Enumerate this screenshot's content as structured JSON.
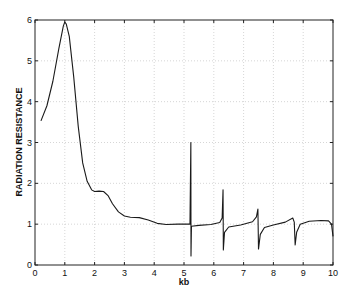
{
  "chart_data": {
    "type": "line",
    "title": "",
    "xlabel": "kb",
    "ylabel": "RADIATION  RESISTANCE",
    "xlim": [
      0,
      10
    ],
    "ylim": [
      0,
      6
    ],
    "grid": true,
    "legend": null,
    "x_ticks": [
      "0",
      "1",
      "2",
      "3",
      "4",
      "5",
      "6",
      "7",
      "8",
      "9",
      "10"
    ],
    "y_ticks": [
      "0",
      "1",
      "2",
      "3",
      "4",
      "5",
      "6"
    ],
    "series": [
      {
        "name": "radiation resistance",
        "color": "#1a1a1a",
        "points": [
          [
            0.2,
            3.53
          ],
          [
            0.4,
            3.9
          ],
          [
            0.6,
            4.5
          ],
          [
            0.8,
            5.3
          ],
          [
            0.95,
            5.85
          ],
          [
            1.0,
            5.95
          ],
          [
            1.05,
            5.9
          ],
          [
            1.15,
            5.6
          ],
          [
            1.3,
            4.6
          ],
          [
            1.45,
            3.4
          ],
          [
            1.6,
            2.5
          ],
          [
            1.75,
            2.05
          ],
          [
            1.9,
            1.84
          ],
          [
            2.0,
            1.8
          ],
          [
            2.15,
            1.81
          ],
          [
            2.3,
            1.8
          ],
          [
            2.45,
            1.7
          ],
          [
            2.6,
            1.5
          ],
          [
            2.8,
            1.3
          ],
          [
            3.0,
            1.2
          ],
          [
            3.2,
            1.17
          ],
          [
            3.5,
            1.16
          ],
          [
            3.8,
            1.1
          ],
          [
            4.1,
            1.02
          ],
          [
            4.4,
            0.99
          ],
          [
            4.8,
            1.0
          ],
          [
            5.1,
            1.0
          ],
          [
            5.2,
            1.0
          ],
          [
            5.23,
            3.0
          ],
          [
            5.235,
            0.22
          ],
          [
            5.25,
            0.95
          ],
          [
            5.5,
            0.97
          ],
          [
            5.9,
            0.99
          ],
          [
            6.2,
            1.04
          ],
          [
            6.28,
            1.15
          ],
          [
            6.31,
            1.84
          ],
          [
            6.32,
            0.37
          ],
          [
            6.36,
            0.8
          ],
          [
            6.5,
            0.93
          ],
          [
            6.9,
            0.98
          ],
          [
            7.3,
            1.06
          ],
          [
            7.43,
            1.18
          ],
          [
            7.48,
            1.37
          ],
          [
            7.5,
            0.39
          ],
          [
            7.56,
            0.75
          ],
          [
            7.7,
            0.92
          ],
          [
            8.0,
            0.98
          ],
          [
            8.4,
            1.05
          ],
          [
            8.65,
            1.15
          ],
          [
            8.7,
            1.05
          ],
          [
            8.73,
            0.49
          ],
          [
            8.78,
            0.8
          ],
          [
            8.9,
            1.0
          ],
          [
            9.2,
            1.07
          ],
          [
            9.6,
            1.09
          ],
          [
            9.85,
            1.08
          ],
          [
            9.95,
            1.0
          ],
          [
            10.0,
            0.7
          ]
        ]
      }
    ],
    "annotations": [
      {
        "kb": 5.23,
        "peak": 3.0,
        "trough": 0.22
      },
      {
        "kb": 6.31,
        "peak": 1.84,
        "trough": 0.37
      },
      {
        "kb": 7.48,
        "peak": 1.37,
        "trough": 0.39
      },
      {
        "kb": 8.72,
        "peak": 1.15,
        "trough": 0.49
      }
    ]
  },
  "plot": {
    "x_axis_title": "kb",
    "y_axis_title": "RADIATION  RESISTANCE"
  }
}
